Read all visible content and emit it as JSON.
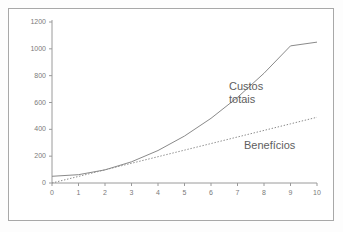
{
  "chart_data": {
    "type": "line",
    "title": "",
    "subtitle": "",
    "xlabel": "",
    "ylabel": "",
    "xlim": [
      0,
      10
    ],
    "ylim": [
      0,
      1200
    ],
    "grid": false,
    "legend_position": "inline-annotation",
    "x_ticks": [
      "0",
      "1",
      "2",
      "3",
      "4",
      "5",
      "6",
      "7",
      "8",
      "9",
      "10"
    ],
    "y_ticks": [
      "0",
      "200",
      "400",
      "600",
      "800",
      "1000",
      "1200"
    ],
    "x_tick_values": [
      0,
      1,
      2,
      3,
      4,
      5,
      6,
      7,
      8,
      9,
      10
    ],
    "y_tick_values": [
      0,
      200,
      400,
      600,
      800,
      1000,
      1200
    ],
    "x": [
      0,
      1,
      2,
      3,
      4,
      5,
      6,
      7,
      8,
      9,
      10
    ],
    "series": [
      {
        "name": "Custos totais",
        "style": "solid",
        "color": "#8a8a8a",
        "values": [
          50,
          62,
          98,
          158,
          242,
          350,
          482,
          638,
          818,
          1022,
          1050
        ]
      },
      {
        "name": "Benefícios",
        "style": "dotted",
        "color": "#8a8a8a",
        "values": [
          0,
          49,
          98,
          147,
          196,
          245,
          294,
          343,
          392,
          441,
          490
        ]
      }
    ],
    "annotations": [
      {
        "text": "Custos",
        "line2": "totais",
        "x": 6.6,
        "y": 800
      },
      {
        "text": "Benefícios",
        "line2": "",
        "x": 7.3,
        "y": 420
      }
    ]
  },
  "labels": {
    "costs_line1": "Custos",
    "costs_line2": "totais",
    "benefits": "Benefícios"
  },
  "colors": {
    "axis": "#9a9a9a",
    "curve": "#8a8a8a",
    "text": "#6e6e6e",
    "frame": "#a8a8a8",
    "background": "#ffffff"
  }
}
